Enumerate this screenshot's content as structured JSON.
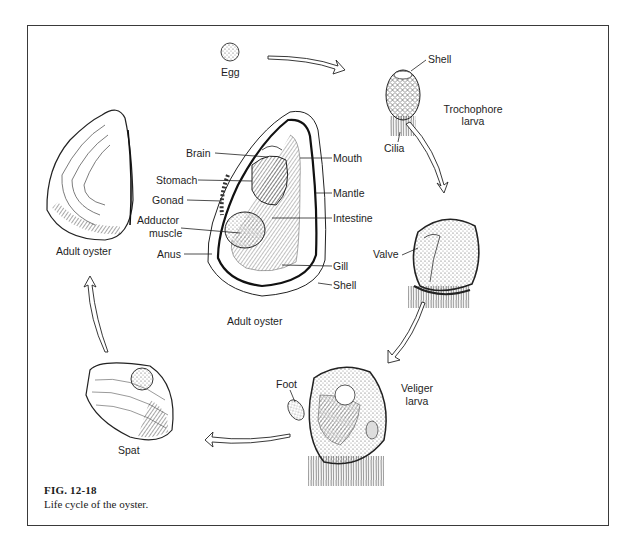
{
  "figure": {
    "number": "FIG. 12-18",
    "caption": "Life cycle of the oyster."
  },
  "stages": {
    "egg": {
      "label": "Egg"
    },
    "trochophore": {
      "label_line1": "Trochophore",
      "label_line2": "larva",
      "parts": {
        "shell": "Shell",
        "cilia": "Cilia"
      }
    },
    "valve_stage": {
      "parts": {
        "valve": "Valve"
      }
    },
    "veliger": {
      "label_line1": "Veliger",
      "label_line2": "larva",
      "parts": {
        "foot": "Foot"
      }
    },
    "spat": {
      "label": "Spat"
    },
    "adult_external": {
      "label": "Adult oyster"
    },
    "adult_internal": {
      "label": "Adult oyster",
      "parts_left": {
        "brain": "Brain",
        "stomach": "Stomach",
        "gonad": "Gonad",
        "adductor_line1": "Adductor",
        "adductor_line2": "muscle",
        "anus": "Anus"
      },
      "parts_right": {
        "mouth": "Mouth",
        "mantle": "Mantle",
        "intestine": "Intestine",
        "gill": "Gill",
        "shell": "Shell"
      }
    }
  },
  "cycle_order": [
    "Egg",
    "Trochophore larva",
    "Valve stage",
    "Veliger larva",
    "Spat",
    "Adult oyster"
  ],
  "colors": {
    "ink": "#1a1a1a",
    "frame": "#3a3a3a",
    "background": "#ffffff"
  }
}
